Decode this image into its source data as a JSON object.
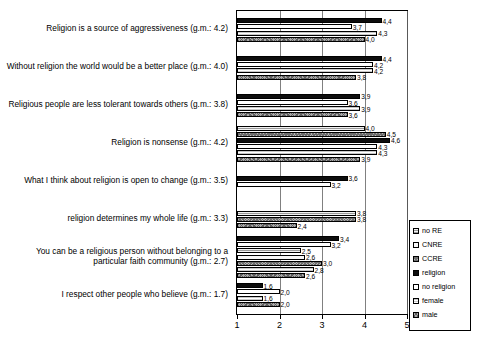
{
  "chart_data": {
    "type": "bar",
    "orientation": "horizontal",
    "title": "",
    "xlabel": "",
    "ylabel": "",
    "xlim": [
      1,
      5
    ],
    "xticks": [
      "1",
      "2",
      "3",
      "4",
      "5"
    ],
    "grid": true,
    "legend_position": "right",
    "legend": [
      "no RE",
      "CNRE",
      "CCRE",
      "religion",
      "no religion",
      "female",
      "male"
    ],
    "categories": [
      "Religion is a source of aggressiveness (g.m.: 4.2)",
      "Without religion the world would be a better place (g.m.: 4.0)",
      "Religious people are less tolerant towards others (g.m.: 3.8)",
      "Religion is nonsense (g.m.: 4.2)",
      "What I think about religion is open to change (g.m.: 3.5)",
      "religion determines my whole life (g.m.: 3.3)",
      "You can be a religious person without belonging to a particular faith community (g.m.: 2.7)",
      "I respect other people who believe (g.m.: 1.7)"
    ],
    "groups": [
      {
        "category_index": 0,
        "bars": [
          {
            "series": "religion",
            "value": 4.4,
            "label": "4,4"
          },
          {
            "series": "no religion",
            "value": 3.7,
            "label": "3,7"
          },
          {
            "series": "female",
            "value": 4.3,
            "label": "4,3"
          },
          {
            "series": "male",
            "value": 4.0,
            "label": "4,0"
          }
        ]
      },
      {
        "category_index": 1,
        "bars": [
          {
            "series": "religion",
            "value": 4.4,
            "label": "4,4"
          },
          {
            "series": "no religion",
            "value": 4.2,
            "label": "4,2"
          },
          {
            "series": "female",
            "value": 4.2,
            "label": "4,2"
          },
          {
            "series": "male",
            "value": 3.8,
            "label": "3,8"
          }
        ]
      },
      {
        "category_index": 2,
        "bars": [
          {
            "series": "religion",
            "value": 3.9,
            "label": "3,9"
          },
          {
            "series": "no religion",
            "value": 3.6,
            "label": "3,6"
          },
          {
            "series": "female",
            "value": 3.9,
            "label": "3,9"
          },
          {
            "series": "male",
            "value": 3.6,
            "label": "3,6"
          }
        ]
      },
      {
        "category_index": 3,
        "bars": [
          {
            "series": "no RE",
            "value": 4.0,
            "label": "4,0"
          },
          {
            "series": "CCRE",
            "value": 4.5,
            "label": "4,5"
          },
          {
            "series": "religion",
            "value": 4.6,
            "label": "4,6"
          },
          {
            "series": "no religion",
            "value": 4.3,
            "label": "4,3"
          },
          {
            "series": "female",
            "value": 4.3,
            "label": "4,3"
          },
          {
            "series": "male",
            "value": 3.9,
            "label": "3,9"
          }
        ]
      },
      {
        "category_index": 4,
        "bars": [
          {
            "series": "religion",
            "value": 3.6,
            "label": "3,6"
          },
          {
            "series": "no religion",
            "value": 3.2,
            "label": "3,2"
          }
        ]
      },
      {
        "category_index": 5,
        "bars": [
          {
            "series": "no RE",
            "value": 3.8,
            "label": "3,8"
          },
          {
            "series": "CCRE",
            "value": 3.8,
            "label": "3,8"
          },
          {
            "series": "male",
            "value": 2.4,
            "label": "2,4"
          }
        ]
      },
      {
        "category_index": 6,
        "bars": [
          {
            "series": "religion",
            "value": 3.4,
            "label": "3,4"
          },
          {
            "series": "no religion",
            "value": 3.2,
            "label": "3,2"
          },
          {
            "series": "no RE",
            "value": 2.5,
            "label": "2,5"
          },
          {
            "series": "CNRE",
            "value": 2.6,
            "label": "2,6"
          },
          {
            "series": "CCRE",
            "value": 3.0,
            "label": "3,0"
          },
          {
            "series": "female",
            "value": 2.8,
            "label": "2,8"
          },
          {
            "series": "male",
            "value": 2.6,
            "label": "2,6"
          }
        ]
      },
      {
        "category_index": 7,
        "bars": [
          {
            "series": "religion",
            "value": 1.6,
            "label": "1,6"
          },
          {
            "series": "no religion",
            "value": 2.0,
            "label": "2,0"
          },
          {
            "series": "female",
            "value": 1.6,
            "label": "1,6"
          },
          {
            "series": "male",
            "value": 2.0,
            "label": "2,0"
          }
        ]
      }
    ]
  }
}
